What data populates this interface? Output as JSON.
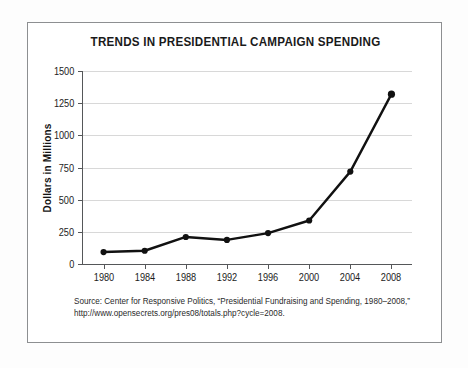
{
  "chart_data": {
    "type": "line",
    "title": "TRENDS IN PRESIDENTIAL CAMPAIGN SPENDING",
    "xlabel": "",
    "ylabel": "Dollars in Millions",
    "categories": [
      "1980",
      "1984",
      "1988",
      "1992",
      "1996",
      "2000",
      "2004",
      "2008"
    ],
    "values": [
      93,
      103,
      210,
      187,
      240,
      338,
      718,
      1320
    ],
    "series": [
      {
        "name": "Presidential campaign spending",
        "values": [
          93,
          103,
          210,
          187,
          240,
          338,
          718,
          1320
        ]
      }
    ],
    "ylim": [
      0,
      1500
    ],
    "yticks": [
      0,
      250,
      500,
      750,
      1000,
      1250,
      1500
    ],
    "ytick_labels": [
      "0",
      "250",
      "500",
      "750",
      "1000",
      "1250",
      "1500"
    ],
    "xtick_labels": [
      "1980",
      "1984",
      "1988",
      "1992",
      "1996",
      "2000",
      "2004",
      "2008"
    ],
    "grid": "horizontal",
    "legend": "none",
    "line_color": "#111111",
    "marker": "circle",
    "marker_color": "#111111"
  },
  "source_note": {
    "line1": "Source:  Center for Responsive Politics, “Presidential Fundraising and Spending, 1980–2008,”",
    "line2": "http://www.opensecrets.org/pres08/totals.php?cycle=2008."
  },
  "colors": {
    "border": "#8d8f91",
    "gridline": "#d8d8d8",
    "axis": "#555759",
    "text": "#1c1c1c",
    "background": "#ffffff"
  }
}
